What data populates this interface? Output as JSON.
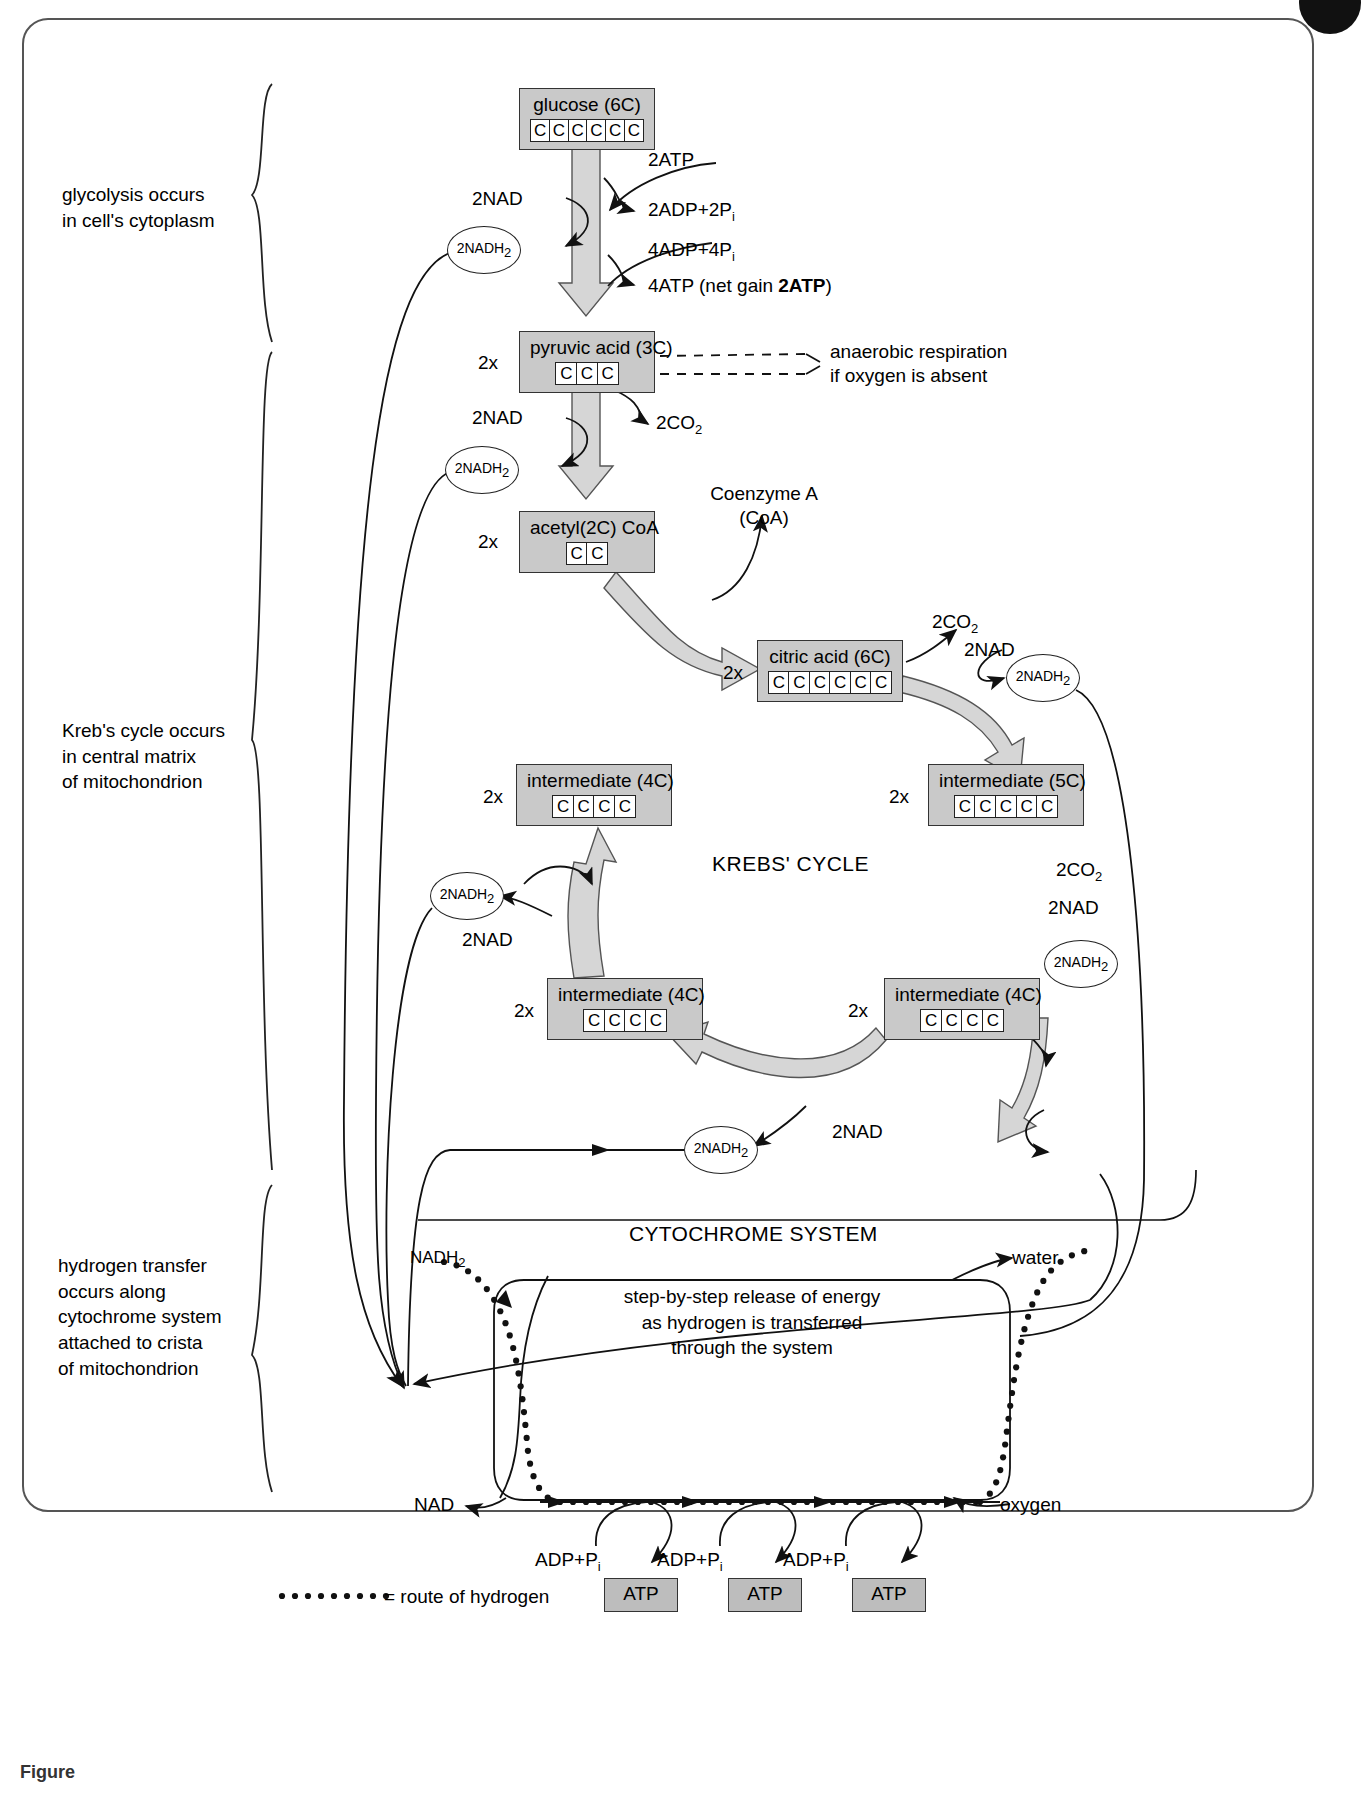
{
  "figure": {
    "caption": "Figure",
    "krebs_title": "KREBS' CYCLE",
    "cytochrome_title": "CYTOCHROME SYSTEM",
    "cytochrome_body": "step-by-step release of energy\nas hydrogen is transferred\nthrough the system",
    "legend_text": "= route of hydrogen"
  },
  "side_notes": [
    {
      "id": "glycolysis",
      "text": "glycolysis occurs\nin cell's cytoplasm"
    },
    {
      "id": "krebs",
      "text": "Kreb's cycle occurs\nin central matrix\nof mitochondrion"
    },
    {
      "id": "hydrogen",
      "text": "hydrogen transfer\noccurs along\ncytochrome system\nattached to crista\nof mitochondrion"
    }
  ],
  "molecule_boxes": [
    {
      "id": "glucose",
      "name": "glucose (6C)",
      "carbons": 6,
      "multiplier": ""
    },
    {
      "id": "pyruvic",
      "name": "pyruvic acid (3C)",
      "carbons": 3,
      "multiplier": "2x"
    },
    {
      "id": "acetyl",
      "name": "acetyl(2C) CoA",
      "carbons": 2,
      "multiplier": "2x"
    },
    {
      "id": "citric",
      "name": "citric acid (6C)",
      "carbons": 6,
      "multiplier": "2x"
    },
    {
      "id": "inter5c",
      "name": "intermediate (5C)",
      "carbons": 5,
      "multiplier": "2x"
    },
    {
      "id": "inter4c-right",
      "name": "intermediate (4C)",
      "carbons": 4,
      "multiplier": "2x"
    },
    {
      "id": "inter4c-bottom",
      "name": "intermediate (4C)",
      "carbons": 4,
      "multiplier": "2x"
    },
    {
      "id": "inter4c-left",
      "name": "intermediate (4C)",
      "carbons": 4,
      "multiplier": "2x"
    }
  ],
  "carbon_letter": "C",
  "atp_products": [
    {
      "id": "atp-1",
      "label": "ATP"
    },
    {
      "id": "atp-2",
      "label": "ATP"
    },
    {
      "id": "atp-3",
      "label": "ATP"
    }
  ],
  "adp_inputs": [
    {
      "id": "adp-1",
      "prefix": "ADP+P",
      "sub": "i"
    },
    {
      "id": "adp-2",
      "prefix": "ADP+P",
      "sub": "i"
    },
    {
      "id": "adp-3",
      "prefix": "ADP+P",
      "sub": "i"
    }
  ],
  "glycolysis_labels": {
    "atp_in": "2ATP",
    "adp_out": {
      "prefix": "2ADP+2P",
      "sub": "i"
    },
    "adp_in": {
      "prefix": "4ADP+4P",
      "sub": "i"
    },
    "atp_out_pre": "4ATP (net gain ",
    "atp_out_bold": "2ATP",
    "atp_out_post": ")",
    "nad": "2NAD",
    "nadh": "2NADH",
    "nadh_sub": "2"
  },
  "link_reaction_labels": {
    "nad": "2NAD",
    "nadh": "2NADH",
    "nadh_sub": "2",
    "co2": {
      "prefix": "2CO",
      "sub": "2"
    },
    "coa": "Coenzyme A\n(CoA)"
  },
  "anaerobic_note": "anaerobic respiration\nif oxygen is absent",
  "krebs_labels": {
    "co2_top": {
      "prefix": "2CO",
      "sub": "2"
    },
    "nad_top": "2NAD",
    "nadh_top": "2NADH",
    "co2_right": {
      "prefix": "2CO",
      "sub": "2"
    },
    "nad_right": "2NAD",
    "nadh_right": "2NADH",
    "nad_bottom": "2NAD",
    "nadh_bottom": "2NADH",
    "nad_left": "2NAD",
    "nadh_left": "2NADH",
    "nadh_sub": "2"
  },
  "cytochrome_labels": {
    "nadh_in": "NADH",
    "nadh_in_sub": "2",
    "nad_out": "NAD",
    "water": "water",
    "oxygen": "oxygen"
  },
  "colors": {
    "box_fill": "#c9c9c9",
    "atp_fill": "#bdbdbd",
    "arrow_fill": "#d6d6d6",
    "stroke": "#222222",
    "frame": "#555555"
  },
  "chart_data": {
    "type": "diagram",
    "stages": [
      {
        "stage": "glycolysis",
        "location": "cell's cytoplasm",
        "inputs": [
          "glucose (6C)",
          "2ATP",
          "4ADP+4Pi",
          "2NAD"
        ],
        "outputs": [
          "2 x pyruvic acid (3C)",
          "2ADP+2Pi",
          "4ATP (net gain 2ATP)",
          "2NADH2"
        ]
      },
      {
        "stage": "link reaction",
        "location": "mitochondrion",
        "inputs": [
          "2 x pyruvic acid (3C)",
          "2NAD",
          "Coenzyme A (CoA)"
        ],
        "outputs": [
          "2 x acetyl(2C) CoA",
          "2CO2",
          "2NADH2"
        ]
      },
      {
        "stage": "Krebs' cycle",
        "location": "central matrix of mitochondrion",
        "intermediates": [
          "citric acid (6C)",
          "intermediate (5C)",
          "intermediate (4C)",
          "intermediate (4C)",
          "intermediate (4C)"
        ],
        "outputs": [
          "2CO2 (x2)",
          "2NADH2 (x4)"
        ]
      },
      {
        "stage": "cytochrome system",
        "location": "crista of mitochondrion",
        "inputs": [
          "NADH2",
          "oxygen",
          "3 x ADP+Pi"
        ],
        "outputs": [
          "NAD",
          "water",
          "3 x ATP"
        ]
      }
    ]
  }
}
